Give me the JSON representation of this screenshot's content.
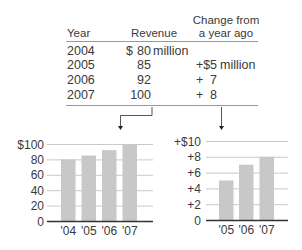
{
  "table": {
    "headers": [
      "Year",
      "Revenue",
      "Change from a year ago"
    ],
    "header_change_lines": [
      "Change from",
      "a year ago"
    ],
    "rows": [
      {
        "year": "2004",
        "revenue_prefix": "$",
        "revenue": "80",
        "revenue_unit": "million",
        "change_prefix": "",
        "change": "",
        "change_unit": ""
      },
      {
        "year": "2005",
        "revenue_prefix": "",
        "revenue": "85",
        "revenue_unit": "",
        "change_prefix": "+$",
        "change": "5",
        "change_unit": "million"
      },
      {
        "year": "2006",
        "revenue_prefix": "",
        "revenue": "92",
        "revenue_unit": "",
        "change_prefix": "+",
        "change": "7",
        "change_unit": ""
      },
      {
        "year": "2007",
        "revenue_prefix": "",
        "revenue": "100",
        "revenue_unit": "",
        "change_prefix": "+",
        "change": "8",
        "change_unit": ""
      }
    ]
  },
  "colors": {
    "bar": "#c8c8c8",
    "grid": "#c9c9c9",
    "axis": "#333333",
    "text": "#3a3a3a"
  },
  "chart_data": [
    {
      "type": "bar",
      "title": "",
      "xlabel": "",
      "ylabel": "Revenue ($ million)",
      "categories": [
        "'04",
        "'05",
        "'06",
        "'07"
      ],
      "values": [
        80,
        85,
        92,
        100
      ],
      "ylim": [
        0,
        100
      ],
      "yticks": [
        0,
        20,
        40,
        60,
        80,
        100
      ],
      "ytick_labels": [
        "0",
        "20",
        "40",
        "60",
        "80",
        "$100"
      ],
      "grid": true,
      "legend": "none"
    },
    {
      "type": "bar",
      "title": "",
      "xlabel": "",
      "ylabel": "Change from a year ago ($ million)",
      "categories": [
        "'05",
        "'06",
        "'07"
      ],
      "values": [
        5,
        7,
        8
      ],
      "ylim": [
        0,
        10
      ],
      "yticks": [
        0,
        2,
        4,
        6,
        8,
        10
      ],
      "ytick_labels": [
        "0",
        "+2",
        "+4",
        "+6",
        "+8",
        "+$10"
      ],
      "grid": true,
      "legend": "none"
    }
  ]
}
